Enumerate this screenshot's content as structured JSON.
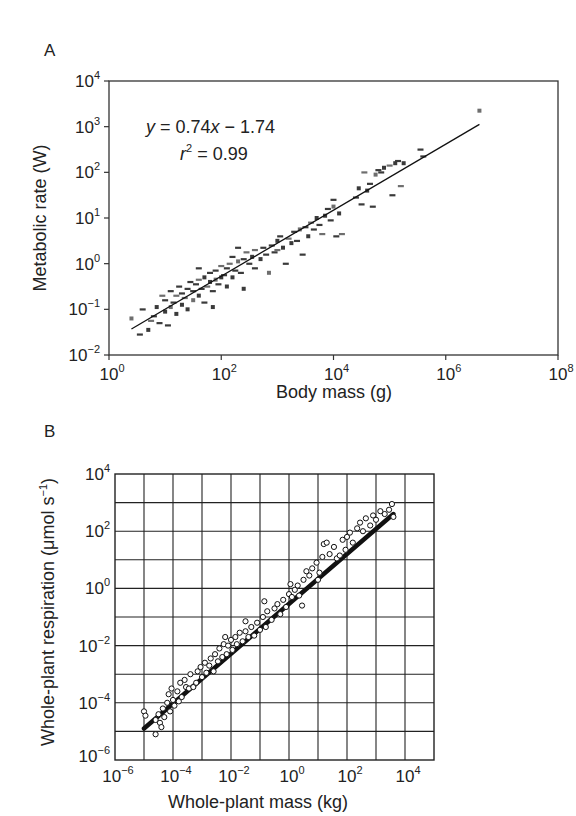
{
  "chart_data": [
    {
      "panel": "A",
      "type": "scatter",
      "title": "",
      "xlabel": "Body mass (g)",
      "ylabel": "Metabolic rate (W)",
      "xscale": "log",
      "yscale": "log",
      "xlim_log10": [
        0,
        8
      ],
      "ylim_log10": [
        -2,
        4
      ],
      "xticks": [
        {
          "base": "10",
          "exp": "0",
          "log": 0
        },
        {
          "base": "10",
          "exp": "2",
          "log": 2
        },
        {
          "base": "10",
          "exp": "4",
          "log": 4
        },
        {
          "base": "10",
          "exp": "6",
          "log": 6
        },
        {
          "base": "10",
          "exp": "8",
          "log": 8
        }
      ],
      "yticks": [
        {
          "base": "10",
          "exp": "−2",
          "log": -2
        },
        {
          "base": "10",
          "exp": "−1",
          "log": -1
        },
        {
          "base": "10",
          "exp": "0",
          "log": 0
        },
        {
          "base": "10",
          "exp": "1",
          "log": 1
        },
        {
          "base": "10",
          "exp": "2",
          "log": 2
        },
        {
          "base": "10",
          "exp": "3",
          "log": 3
        },
        {
          "base": "10",
          "exp": "4",
          "log": 4
        }
      ],
      "grid": false,
      "marker": "small dark-gray squares/dashes",
      "annotation": {
        "equation_prefix": "y",
        "equation_mid": " = 0.74",
        "equation_x": "x",
        "equation_suffix": " − 1.74",
        "r_symbol": "r",
        "r_exp": "2",
        "r_value": " = 0.99"
      },
      "fit_line": {
        "slope": 0.74,
        "intercept": -1.74,
        "x_log_range": [
          0.4,
          6.6
        ],
        "y_log_range": [
          -1.43,
          3.05
        ]
      },
      "series": [
        {
          "name": "Animals",
          "points_log10": [
            [
              0.4,
              -1.2
            ],
            [
              0.55,
              -1.55
            ],
            [
              0.6,
              -1.0
            ],
            [
              0.7,
              -1.45
            ],
            [
              0.75,
              -1.25
            ],
            [
              0.8,
              -1.15
            ],
            [
              0.85,
              -0.95
            ],
            [
              0.9,
              -1.3
            ],
            [
              0.95,
              -0.7
            ],
            [
              1.0,
              -1.05
            ],
            [
              1.0,
              -0.8
            ],
            [
              1.05,
              -1.35
            ],
            [
              1.1,
              -0.95
            ],
            [
              1.1,
              -0.6
            ],
            [
              1.15,
              -0.85
            ],
            [
              1.2,
              -1.1
            ],
            [
              1.2,
              -0.7
            ],
            [
              1.25,
              -0.5
            ],
            [
              1.3,
              -0.9
            ],
            [
              1.3,
              -0.65
            ],
            [
              1.35,
              -0.75
            ],
            [
              1.4,
              -1.0
            ],
            [
              1.4,
              -0.55
            ],
            [
              1.45,
              -0.4
            ],
            [
              1.5,
              -0.8
            ],
            [
              1.5,
              -0.6
            ],
            [
              1.55,
              -0.45
            ],
            [
              1.6,
              -0.7
            ],
            [
              1.6,
              -0.35
            ],
            [
              1.65,
              -0.55
            ],
            [
              1.7,
              -0.3
            ],
            [
              1.7,
              -0.85
            ],
            [
              1.75,
              -0.5
            ],
            [
              1.8,
              -0.4
            ],
            [
              1.8,
              -0.2
            ],
            [
              1.85,
              -0.6
            ],
            [
              1.9,
              -0.35
            ],
            [
              1.9,
              -0.15
            ],
            [
              1.95,
              -0.45
            ],
            [
              2.0,
              -0.3
            ],
            [
              2.0,
              -0.05
            ],
            [
              2.05,
              -0.25
            ],
            [
              2.1,
              -0.5
            ],
            [
              2.1,
              -0.1
            ],
            [
              2.15,
              0.0
            ],
            [
              2.2,
              -0.3
            ],
            [
              2.2,
              0.15
            ],
            [
              2.25,
              -0.15
            ],
            [
              2.3,
              0.05
            ],
            [
              2.35,
              -0.2
            ],
            [
              2.4,
              0.1
            ],
            [
              2.4,
              -0.55
            ],
            [
              2.45,
              0.25
            ],
            [
              2.5,
              0.0
            ],
            [
              2.55,
              0.15
            ],
            [
              2.6,
              -0.1
            ],
            [
              2.6,
              0.3
            ],
            [
              2.7,
              0.1
            ],
            [
              2.75,
              0.35
            ],
            [
              2.8,
              0.2
            ],
            [
              2.85,
              -0.2
            ],
            [
              2.9,
              0.4
            ],
            [
              2.95,
              0.25
            ],
            [
              3.0,
              0.5
            ],
            [
              3.0,
              0.3
            ],
            [
              3.05,
              0.6
            ],
            [
              3.1,
              0.35
            ],
            [
              3.15,
              0.0
            ],
            [
              3.2,
              0.55
            ],
            [
              3.25,
              0.45
            ],
            [
              3.3,
              0.7
            ],
            [
              3.35,
              0.5
            ],
            [
              3.4,
              0.75
            ],
            [
              3.45,
              0.2
            ],
            [
              3.5,
              0.8
            ],
            [
              3.55,
              0.6
            ],
            [
              3.6,
              0.9
            ],
            [
              3.65,
              0.75
            ],
            [
              3.7,
              1.0
            ],
            [
              3.75,
              0.85
            ],
            [
              3.8,
              0.65
            ],
            [
              3.85,
              1.05
            ],
            [
              3.9,
              1.2
            ],
            [
              3.95,
              0.95
            ],
            [
              4.0,
              1.25
            ],
            [
              4.0,
              1.4
            ],
            [
              4.05,
              0.6
            ],
            [
              4.1,
              1.1
            ],
            [
              4.15,
              0.65
            ],
            [
              4.4,
              1.45
            ],
            [
              4.45,
              1.65
            ],
            [
              4.5,
              1.3
            ],
            [
              4.55,
              2.0
            ],
            [
              4.6,
              1.6
            ],
            [
              4.65,
              1.75
            ],
            [
              4.7,
              1.25
            ],
            [
              4.75,
              1.95
            ],
            [
              4.8,
              2.05
            ],
            [
              4.85,
              2.0
            ],
            [
              4.9,
              2.1
            ],
            [
              5.0,
              2.15
            ],
            [
              5.05,
              1.5
            ],
            [
              5.1,
              2.2
            ],
            [
              5.15,
              2.25
            ],
            [
              5.2,
              1.7
            ],
            [
              5.25,
              2.2
            ],
            [
              5.55,
              2.5
            ],
            [
              5.6,
              2.35
            ],
            [
              6.6,
              3.35
            ],
            [
              1.6,
              -0.1
            ],
            [
              2.3,
              0.35
            ],
            [
              1.85,
              -0.95
            ]
          ]
        }
      ]
    },
    {
      "panel": "B",
      "type": "scatter",
      "title": "",
      "xlabel": "Whole-plant mass (kg)",
      "ylabel_main": "Whole-plant respiration (μmol s",
      "ylabel_exp": "−1",
      "ylabel_close": ")",
      "xscale": "log",
      "yscale": "log",
      "xlim_log10": [
        -6,
        5
      ],
      "ylim_log10": [
        -6,
        4
      ],
      "xticks": [
        {
          "base": "10",
          "exp": "−6",
          "log": -6
        },
        {
          "base": "10",
          "exp": "−4",
          "log": -4
        },
        {
          "base": "10",
          "exp": "−2",
          "log": -2
        },
        {
          "base": "10",
          "exp": "0",
          "log": 0
        },
        {
          "base": "10",
          "exp": "2",
          "log": 2
        },
        {
          "base": "10",
          "exp": "4",
          "log": 4
        }
      ],
      "yticks": [
        {
          "base": "10",
          "exp": "−6",
          "log": -6
        },
        {
          "base": "10",
          "exp": "−4",
          "log": -4
        },
        {
          "base": "10",
          "exp": "−2",
          "log": -2
        },
        {
          "base": "10",
          "exp": "0",
          "log": 0
        },
        {
          "base": "10",
          "exp": "2",
          "log": 2
        },
        {
          "base": "10",
          "exp": "4",
          "log": 4
        }
      ],
      "grid": true,
      "grid_every_decade": true,
      "marker": "open circles",
      "fit_line": {
        "x_log_range": [
          -5.0,
          3.6
        ],
        "y_log_range": [
          -4.9,
          2.6
        ],
        "style": "thick"
      },
      "series": [
        {
          "name": "Plants",
          "points_log10": [
            [
              -5.0,
              -4.3
            ],
            [
              -4.95,
              -4.45
            ],
            [
              -4.6,
              -5.1
            ],
            [
              -4.6,
              -4.6
            ],
            [
              -4.5,
              -4.4
            ],
            [
              -4.45,
              -4.7
            ],
            [
              -4.4,
              -4.85
            ],
            [
              -4.35,
              -4.2
            ],
            [
              -4.3,
              -4.5
            ],
            [
              -4.2,
              -4.0
            ],
            [
              -4.15,
              -3.7
            ],
            [
              -4.1,
              -4.3
            ],
            [
              -4.05,
              -3.5
            ],
            [
              -4.0,
              -3.9
            ],
            [
              -3.95,
              -4.1
            ],
            [
              -3.85,
              -3.6
            ],
            [
              -3.75,
              -3.3
            ],
            [
              -3.7,
              -3.8
            ],
            [
              -3.6,
              -3.2
            ],
            [
              -3.55,
              -3.45
            ],
            [
              -3.45,
              -3.5
            ],
            [
              -3.4,
              -3.0
            ],
            [
              -3.3,
              -3.45
            ],
            [
              -3.2,
              -3.3
            ],
            [
              -3.15,
              -2.9
            ],
            [
              -3.05,
              -2.75
            ],
            [
              -3.0,
              -3.1
            ],
            [
              -2.9,
              -2.6
            ],
            [
              -2.85,
              -2.95
            ],
            [
              -2.75,
              -2.7
            ],
            [
              -2.7,
              -2.45
            ],
            [
              -2.6,
              -2.9
            ],
            [
              -2.55,
              -2.3
            ],
            [
              -2.45,
              -2.55
            ],
            [
              -2.4,
              -2.1
            ],
            [
              -2.3,
              -2.4
            ],
            [
              -2.25,
              -1.95
            ],
            [
              -2.15,
              -2.3
            ],
            [
              -2.1,
              -2.0
            ],
            [
              -2.0,
              -1.8
            ],
            [
              -1.95,
              -2.15
            ],
            [
              -1.85,
              -1.7
            ],
            [
              -1.8,
              -1.95
            ],
            [
              -1.7,
              -1.55
            ],
            [
              -1.6,
              -1.85
            ],
            [
              -1.5,
              -1.5
            ],
            [
              -1.4,
              -1.7
            ],
            [
              -1.3,
              -1.35
            ],
            [
              -1.2,
              -1.65
            ],
            [
              -1.1,
              -1.2
            ],
            [
              -1.0,
              -1.45
            ],
            [
              -0.9,
              -1.0
            ],
            [
              -0.8,
              -1.35
            ],
            [
              -0.75,
              -0.8
            ],
            [
              -0.6,
              -1.1
            ],
            [
              -0.5,
              -0.7
            ],
            [
              -0.4,
              -0.55
            ],
            [
              -0.3,
              -0.9
            ],
            [
              -0.2,
              -0.4
            ],
            [
              -0.1,
              -0.65
            ],
            [
              0.0,
              -0.2
            ],
            [
              0.05,
              0.15
            ],
            [
              0.1,
              -0.3
            ],
            [
              0.2,
              -0.05
            ],
            [
              0.3,
              0.1
            ],
            [
              0.35,
              -0.25
            ],
            [
              0.5,
              0.3
            ],
            [
              0.6,
              0.6
            ],
            [
              0.7,
              0.45
            ],
            [
              0.8,
              0.7
            ],
            [
              0.95,
              0.9
            ],
            [
              1.05,
              0.55
            ],
            [
              1.15,
              1.1
            ],
            [
              1.2,
              1.55
            ],
            [
              1.3,
              1.6
            ],
            [
              1.4,
              1.2
            ],
            [
              1.55,
              1.45
            ],
            [
              1.65,
              1.05
            ],
            [
              1.75,
              1.15
            ],
            [
              1.85,
              1.7
            ],
            [
              1.95,
              1.35
            ],
            [
              2.0,
              1.8
            ],
            [
              2.1,
              1.95
            ],
            [
              2.2,
              1.6
            ],
            [
              2.35,
              2.1
            ],
            [
              2.45,
              2.3
            ],
            [
              2.55,
              2.0
            ],
            [
              2.65,
              2.45
            ],
            [
              2.8,
              2.2
            ],
            [
              2.9,
              2.55
            ],
            [
              3.0,
              2.4
            ],
            [
              3.15,
              2.7
            ],
            [
              3.3,
              2.6
            ],
            [
              3.45,
              2.75
            ],
            [
              3.55,
              2.95
            ],
            [
              3.6,
              2.5
            ],
            [
              -3.8,
              -3.95
            ],
            [
              -2.2,
              -1.7
            ],
            [
              -0.85,
              -0.45
            ],
            [
              0.45,
              -0.6
            ],
            [
              1.0,
              0.3
            ],
            [
              -1.5,
              -1.15
            ]
          ]
        }
      ]
    }
  ],
  "labels": {
    "panel_a": "A",
    "panel_b": "B",
    "a_xlabel": "Body mass (g)",
    "a_ylabel": "Metabolic rate (W)",
    "b_xlabel": "Whole-plant mass (kg)"
  }
}
